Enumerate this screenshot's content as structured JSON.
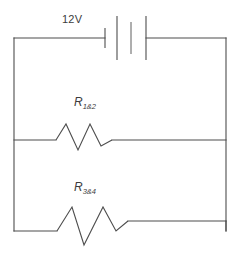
{
  "diagram": {
    "type": "electrical-circuit-schematic",
    "title": "",
    "stroke_color": "#4d4d4d",
    "background_color": "#ffffff",
    "components": [
      {
        "id": "battery",
        "kind": "battery",
        "label": "12V",
        "label_x": 62,
        "label_y": 14,
        "cells": 2,
        "plates": 4
      },
      {
        "id": "resistor-1-2",
        "kind": "resistor",
        "label_main": "R",
        "label_sub": "1&2",
        "label_x": 74,
        "label_y": 96,
        "peaks": 2
      },
      {
        "id": "resistor-3-4",
        "kind": "resistor",
        "label_main": "R",
        "label_sub": "3&4",
        "label_x": 74,
        "label_y": 181,
        "peaks": 2
      }
    ],
    "nodes": {
      "left_rail_x": 14,
      "right_rail_x": 226,
      "top_wire_y": 38,
      "middle_wire_y": 140,
      "bottom_wire_y": 231
    }
  }
}
